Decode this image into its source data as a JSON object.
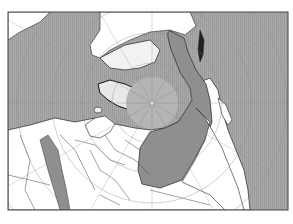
{
  "map": {
    "projection": "north-polar",
    "frame": {
      "x": 8,
      "y": 12,
      "width": 280,
      "height": 198
    },
    "pole": {
      "x": 152,
      "y": 103
    },
    "colors": {
      "ocean": "#a6a6a6",
      "ocean_hatch": "#999999",
      "land": "#ffffff",
      "ice_land": "#e6e6e6",
      "arctic_ocean": "#b3b3b3",
      "highlight_region": "#8f8f8f",
      "coast": "#222222",
      "border": "#555555",
      "graticule": "#9a9a9a",
      "frame": "#444444"
    },
    "legend": [],
    "labels": []
  }
}
